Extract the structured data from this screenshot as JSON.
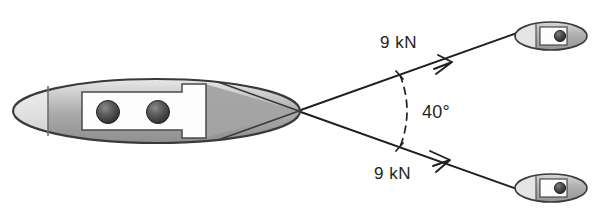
{
  "diagram": {
    "background_color": "#ffffff",
    "ink_color": "#231f20",
    "hull_fill_dark": "#a8a8a8",
    "hull_fill_light": "#dcdcdc",
    "deck_fill": "#fdfdfd",
    "bollard_fill": "#4a4a4a",
    "barge": {
      "name": "towed-barge",
      "bow_panel_present": true,
      "bollard_count": 2
    },
    "tow_lines": [
      {
        "id": "upper-tow-line",
        "force_label": "9 kN",
        "direction": "up-right",
        "has_arrowhead": true
      },
      {
        "id": "lower-tow-line",
        "force_label": "9 kN",
        "direction": "down-right",
        "has_arrowhead": true
      }
    ],
    "angle": {
      "label": "40°",
      "value": 40,
      "unit": "degrees",
      "marker_style": "dashed-arc",
      "between": [
        "upper-tow-line",
        "lower-tow-line"
      ]
    },
    "tugboats": [
      {
        "id": "upper-tugboat",
        "label": ""
      },
      {
        "id": "lower-tugboat",
        "label": ""
      }
    ]
  }
}
